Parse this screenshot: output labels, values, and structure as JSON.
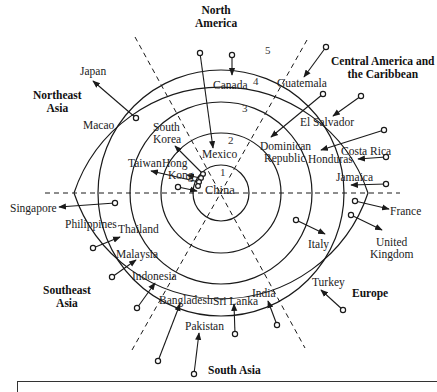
{
  "diagram": {
    "center": {
      "x": 221,
      "y": 193
    },
    "ring_radii": [
      28,
      60,
      91,
      123,
      155
    ],
    "ring_numbers": [
      "1",
      "2",
      "3",
      "4",
      "5"
    ],
    "regions": {
      "north_america": [
        "North",
        "America"
      ],
      "central_america": [
        "Central America and",
        "the Caribbean"
      ],
      "northeast_asia": [
        "Northeast",
        "Asia"
      ],
      "southeast_asia": [
        "Southeast",
        "Asia"
      ],
      "south_asia": "South Asia",
      "europe": "Europe"
    },
    "countries": {
      "china": "China",
      "japan": "Japan",
      "macao": "Macao",
      "south_korea": [
        "South",
        "Korea"
      ],
      "taiwan": "Taiwan",
      "hong_kong": [
        "Hong",
        "Kong"
      ],
      "mexico": "Mexico",
      "canada": "Canada",
      "guatemala": "Guatemala",
      "el_salvador": "El Salvador",
      "dominican_republic": [
        "Dominican",
        "Republic"
      ],
      "honduras": "Honduras",
      "costa_rica": "Costa Rica",
      "jamaica": "Jamaica",
      "france": "France",
      "united_kingdom": [
        "United",
        "Kingdom"
      ],
      "italy": "Italy",
      "turkey": "Turkey",
      "india": "India",
      "sri_lanka": "Sri Lanka",
      "pakistan": "Pakistan",
      "bangladesh": "Bangladesh",
      "indonesia": "Indonesia",
      "malaysia": "Malaysia",
      "thailand": "Thailand",
      "philippines": "Philippines",
      "singapore": "Singapore"
    },
    "colors": {
      "ink": "#1a1a1a",
      "background": "#ffffff"
    }
  }
}
